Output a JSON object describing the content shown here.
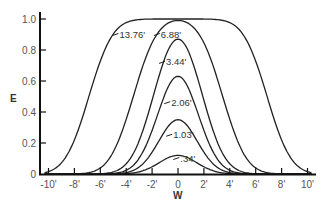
{
  "chart_data": {
    "type": "line",
    "title": "",
    "xlabel": "W",
    "ylabel": "E",
    "xlim": [
      -10.5,
      10.5
    ],
    "ylim": [
      0,
      1.05
    ],
    "grid": false,
    "legend": "inline labels",
    "x_ticks": [
      -10,
      -8,
      -6,
      -4,
      -2,
      0,
      2,
      4,
      6,
      8,
      10
    ],
    "x_tick_labels": [
      "-10'",
      "-8'",
      "-6'",
      "-4'",
      "-2'",
      "0",
      "2'",
      "4'",
      "6'",
      "8'",
      "10'"
    ],
    "y_ticks": [
      0,
      0.2,
      0.4,
      0.6,
      0.8,
      1.0
    ],
    "y_tick_labels": [
      "0",
      "0.2",
      "0.4",
      "0.6",
      "0.8",
      "1.0"
    ],
    "series": [
      {
        "name": "13.76'",
        "label": "13.76'",
        "peak": 1.0,
        "halfwidth": 6.88,
        "label_x": -4.6,
        "label_y": 0.9
      },
      {
        "name": "6.88'",
        "label": "6.88'",
        "peak": 0.99,
        "halfwidth": 3.44,
        "label_x": -1.4,
        "label_y": 0.9
      },
      {
        "name": "3.44'",
        "label": "3.44'",
        "peak": 0.87,
        "halfwidth": 1.72,
        "label_x": -1.0,
        "label_y": 0.72
      },
      {
        "name": "2.06'",
        "label": "2.06'",
        "peak": 0.63,
        "halfwidth": 1.03,
        "label_x": -0.6,
        "label_y": 0.46
      },
      {
        "name": "1.03'",
        "label": "1.03'",
        "peak": 0.35,
        "halfwidth": 0.52,
        "label_x": -0.45,
        "label_y": 0.25
      },
      {
        "name": ".34'",
        "label": ".34'",
        "peak": 0.12,
        "halfwidth": 0.17,
        "label_x": 0.1,
        "label_y": 0.1
      }
    ]
  }
}
